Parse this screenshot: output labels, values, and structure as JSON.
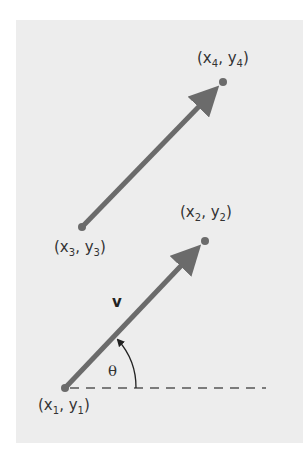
{
  "diagram": {
    "title": "",
    "colors": {
      "background": "#ededed",
      "vector": "#6b6b6b",
      "text": "#333333",
      "dash": "#555555"
    },
    "points": [
      {
        "id": "p1",
        "x_sym": "x",
        "y_sym": "y",
        "sub": "1",
        "label": "(x1, y1)"
      },
      {
        "id": "p2",
        "x_sym": "x",
        "y_sym": "y",
        "sub": "2",
        "label": "(x2, y2)"
      },
      {
        "id": "p3",
        "x_sym": "x",
        "y_sym": "y",
        "sub": "3",
        "label": "(x3, y3)"
      },
      {
        "id": "p4",
        "x_sym": "x",
        "y_sym": "y",
        "sub": "4",
        "label": "(x4, y4)"
      }
    ],
    "vectors": [
      {
        "from": "p1",
        "to": "p2",
        "label": "v"
      },
      {
        "from": "p3",
        "to": "p4",
        "label": ""
      }
    ],
    "angle_label": "θ",
    "reference_line": "horizontal dashed line through (x1, y1)"
  }
}
